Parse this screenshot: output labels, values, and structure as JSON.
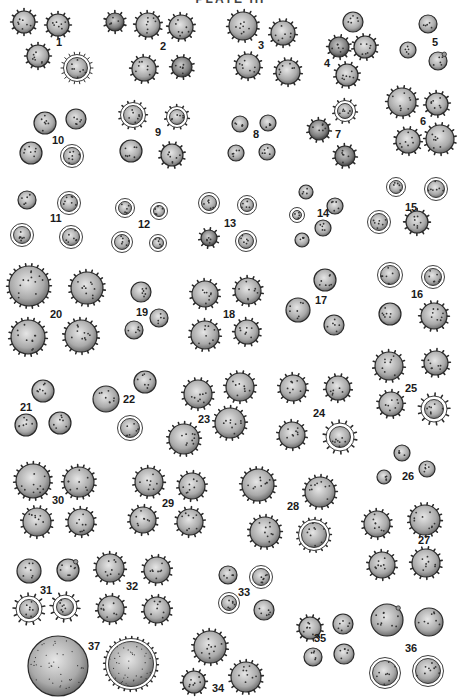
{
  "plate": {
    "title": "PLATE III",
    "ink_color": "#2a2a2a",
    "fill_color": "#bdbdbd",
    "background": "#ffffff"
  },
  "figures": [
    {
      "n": "1",
      "label_xy": [
        56,
        46
      ],
      "grains": [
        [
          24,
          22,
          11,
          "spiny"
        ],
        [
          58,
          25,
          11,
          "spiny"
        ],
        [
          38,
          56,
          11,
          "spiny"
        ],
        [
          77,
          68,
          13,
          "radial"
        ]
      ]
    },
    {
      "n": "2",
      "label_xy": [
        160,
        50
      ],
      "grains": [
        [
          115,
          22,
          9,
          "spiny"
        ],
        [
          148,
          25,
          12,
          "spiny"
        ],
        [
          181,
          27,
          12,
          "spiny"
        ],
        [
          144,
          69,
          12,
          "spiny"
        ],
        [
          182,
          67,
          10,
          "spiny"
        ]
      ]
    },
    {
      "n": "3",
      "label_xy": [
        258,
        49
      ],
      "grains": [
        [
          243,
          26,
          14,
          "spiny"
        ],
        [
          283,
          33,
          12,
          "spiny"
        ],
        [
          248,
          66,
          12,
          "spiny"
        ],
        [
          288,
          72,
          12,
          "spiny"
        ]
      ]
    },
    {
      "n": "4",
      "label_xy": [
        324,
        67
      ],
      "grains": [
        [
          353,
          22,
          10,
          "dotted"
        ],
        [
          339,
          47,
          10,
          "spiny"
        ],
        [
          365,
          47,
          11,
          "spiny"
        ],
        [
          347,
          75,
          11,
          "spiny"
        ]
      ]
    },
    {
      "n": "5",
      "label_xy": [
        432,
        46
      ],
      "grains": [
        [
          428,
          24,
          9,
          "dotted"
        ],
        [
          408,
          50,
          8,
          "dotted"
        ],
        [
          438,
          61,
          9,
          "tipped"
        ]
      ]
    },
    {
      "n": "6",
      "label_xy": [
        420,
        125
      ],
      "grains": [
        [
          402,
          102,
          14,
          "spiny"
        ],
        [
          437,
          104,
          11,
          "spiny"
        ],
        [
          408,
          141,
          12,
          "spiny"
        ],
        [
          440,
          139,
          14,
          "spiny"
        ]
      ]
    },
    {
      "n": "7",
      "label_xy": [
        335,
        138
      ],
      "grains": [
        [
          345,
          111,
          10,
          "ring-spiny"
        ],
        [
          319,
          130,
          10,
          "spiny"
        ],
        [
          345,
          156,
          10,
          "spiny"
        ]
      ]
    },
    {
      "n": "8",
      "label_xy": [
        253,
        138
      ],
      "grains": [
        [
          240,
          124,
          8,
          "dotted"
        ],
        [
          268,
          123,
          8,
          "dotted"
        ],
        [
          236,
          153,
          8,
          "dotted"
        ],
        [
          267,
          152,
          8,
          "dotted"
        ]
      ]
    },
    {
      "n": "9",
      "label_xy": [
        155,
        136
      ],
      "grains": [
        [
          133,
          115,
          12,
          "ring-spiny"
        ],
        [
          177,
          117,
          10,
          "ring-spiny"
        ],
        [
          131,
          151,
          11,
          "dotted"
        ],
        [
          172,
          155,
          11,
          "spiny"
        ]
      ]
    },
    {
      "n": "10",
      "label_xy": [
        52,
        144
      ],
      "grains": [
        [
          45,
          123,
          11,
          "dotted"
        ],
        [
          76,
          119,
          10,
          "dotted"
        ],
        [
          31,
          153,
          11,
          "dotted"
        ],
        [
          72,
          156,
          11,
          "ring"
        ]
      ]
    },
    {
      "n": "11",
      "label_xy": [
        50,
        222
      ],
      "grains": [
        [
          27,
          200,
          9,
          "dotted"
        ],
        [
          69,
          203,
          11,
          "ring"
        ],
        [
          22,
          235,
          11,
          "ring"
        ],
        [
          71,
          237,
          11,
          "ring"
        ]
      ]
    },
    {
      "n": "12",
      "label_xy": [
        138,
        228
      ],
      "grains": [
        [
          125,
          208,
          9,
          "ring"
        ],
        [
          159,
          211,
          8,
          "ring"
        ],
        [
          122,
          242,
          10,
          "ring"
        ],
        [
          158,
          243,
          8,
          "ring"
        ]
      ]
    },
    {
      "n": "13",
      "label_xy": [
        224,
        227
      ],
      "grains": [
        [
          209,
          203,
          10,
          "ring"
        ],
        [
          247,
          205,
          9,
          "ring"
        ],
        [
          209,
          238,
          8,
          "spiny"
        ],
        [
          246,
          241,
          10,
          "ring"
        ]
      ]
    },
    {
      "n": "14",
      "label_xy": [
        317,
        217
      ],
      "grains": [
        [
          306,
          192,
          7,
          "dotted"
        ],
        [
          335,
          206,
          8,
          "dotted"
        ],
        [
          297,
          215,
          7,
          "ring"
        ],
        [
          323,
          228,
          8,
          "dotted"
        ],
        [
          302,
          240,
          7,
          "dotted"
        ]
      ]
    },
    {
      "n": "15",
      "label_xy": [
        405,
        211
      ],
      "grains": [
        [
          396,
          187,
          9,
          "ring"
        ],
        [
          436,
          189,
          11,
          "ring"
        ],
        [
          379,
          222,
          11,
          "ring"
        ],
        [
          417,
          222,
          11,
          "spiny"
        ]
      ]
    },
    {
      "n": "16",
      "label_xy": [
        411,
        298
      ],
      "grains": [
        [
          390,
          275,
          12,
          "ring"
        ],
        [
          433,
          277,
          11,
          "ring"
        ],
        [
          390,
          314,
          11,
          "dotted"
        ],
        [
          434,
          316,
          13,
          "spiny"
        ]
      ]
    },
    {
      "n": "17",
      "label_xy": [
        315,
        304
      ],
      "grains": [
        [
          325,
          280,
          11,
          "dotted"
        ],
        [
          298,
          310,
          12,
          "dotted"
        ],
        [
          334,
          325,
          10,
          "dotted"
        ]
      ]
    },
    {
      "n": "18",
      "label_xy": [
        223,
        318
      ],
      "grains": [
        [
          205,
          294,
          13,
          "spiny"
        ],
        [
          248,
          291,
          13,
          "spiny"
        ],
        [
          205,
          335,
          14,
          "spiny"
        ],
        [
          247,
          332,
          12,
          "spiny"
        ]
      ]
    },
    {
      "n": "19",
      "label_xy": [
        136,
        316
      ],
      "grains": [
        [
          141,
          292,
          10,
          "dotted"
        ],
        [
          159,
          318,
          9,
          "dotted"
        ],
        [
          134,
          330,
          9,
          "dotted"
        ]
      ]
    },
    {
      "n": "20",
      "label_xy": [
        50,
        318
      ],
      "grains": [
        [
          29,
          286,
          20,
          "spiny"
        ],
        [
          87,
          288,
          16,
          "spiny"
        ],
        [
          28,
          337,
          17,
          "spiny"
        ],
        [
          81,
          336,
          16,
          "spiny"
        ]
      ]
    },
    {
      "n": "21",
      "label_xy": [
        20,
        411
      ],
      "grains": [
        [
          43,
          391,
          11,
          "dotted"
        ],
        [
          26,
          425,
          11,
          "dotted"
        ],
        [
          60,
          423,
          11,
          "dotted"
        ]
      ]
    },
    {
      "n": "22",
      "label_xy": [
        123,
        403
      ],
      "grains": [
        [
          106,
          399,
          13,
          "dotted"
        ],
        [
          145,
          382,
          11,
          "dotted"
        ],
        [
          130,
          428,
          12,
          "ring"
        ]
      ]
    },
    {
      "n": "23",
      "label_xy": [
        198,
        423
      ],
      "grains": [
        [
          198,
          394,
          14,
          "spiny"
        ],
        [
          240,
          387,
          14,
          "spiny"
        ],
        [
          184,
          439,
          15,
          "spiny"
        ],
        [
          230,
          423,
          15,
          "spiny"
        ]
      ]
    },
    {
      "n": "24",
      "label_xy": [
        313,
        417
      ],
      "grains": [
        [
          293,
          388,
          13,
          "spiny"
        ],
        [
          338,
          388,
          12,
          "spiny"
        ],
        [
          292,
          435,
          13,
          "spiny"
        ],
        [
          340,
          437,
          13,
          "star"
        ]
      ]
    },
    {
      "n": "25",
      "label_xy": [
        405,
        392
      ],
      "grains": [
        [
          389,
          366,
          14,
          "spiny"
        ],
        [
          436,
          363,
          12,
          "spiny"
        ],
        [
          391,
          404,
          12,
          "spiny"
        ],
        [
          434,
          409,
          12,
          "star"
        ]
      ]
    },
    {
      "n": "26",
      "label_xy": [
        402,
        480
      ],
      "grains": [
        [
          402,
          453,
          8,
          "dotted"
        ],
        [
          384,
          477,
          7,
          "dotted"
        ],
        [
          427,
          469,
          8,
          "dotted"
        ]
      ]
    },
    {
      "n": "27",
      "label_xy": [
        418,
        544
      ],
      "grains": [
        [
          377,
          524,
          13,
          "spiny"
        ],
        [
          425,
          520,
          15,
          "spiny"
        ],
        [
          382,
          565,
          13,
          "spiny"
        ],
        [
          426,
          563,
          14,
          "spiny"
        ]
      ]
    },
    {
      "n": "28",
      "label_xy": [
        287,
        510
      ],
      "grains": [
        [
          258,
          485,
          16,
          "spiny"
        ],
        [
          320,
          492,
          15,
          "spiny"
        ],
        [
          265,
          532,
          15,
          "spiny"
        ],
        [
          314,
          535,
          15,
          "ring-spiny"
        ]
      ]
    },
    {
      "n": "29",
      "label_xy": [
        162,
        507
      ],
      "grains": [
        [
          149,
          482,
          14,
          "spiny"
        ],
        [
          192,
          486,
          13,
          "spiny"
        ],
        [
          143,
          520,
          13,
          "spiny"
        ],
        [
          190,
          522,
          13,
          "spiny"
        ]
      ]
    },
    {
      "n": "30",
      "label_xy": [
        52,
        504
      ],
      "grains": [
        [
          33,
          481,
          17,
          "spiny"
        ],
        [
          79,
          482,
          15,
          "spiny"
        ],
        [
          37,
          522,
          14,
          "spiny"
        ],
        [
          81,
          522,
          13,
          "spiny"
        ]
      ]
    },
    {
      "n": "31",
      "label_xy": [
        40,
        594
      ],
      "grains": [
        [
          29,
          571,
          12,
          "dotted"
        ],
        [
          68,
          570,
          11,
          "tipped"
        ],
        [
          29,
          609,
          12,
          "star"
        ],
        [
          65,
          607,
          11,
          "star"
        ]
      ]
    },
    {
      "n": "32",
      "label_xy": [
        126,
        590
      ],
      "grains": [
        [
          110,
          568,
          14,
          "spiny"
        ],
        [
          157,
          570,
          13,
          "spiny"
        ],
        [
          111,
          609,
          13,
          "spiny"
        ],
        [
          157,
          610,
          13,
          "spiny"
        ]
      ]
    },
    {
      "n": "33",
      "label_xy": [
        238,
        596
      ],
      "grains": [
        [
          228,
          575,
          9,
          "dotted"
        ],
        [
          261,
          577,
          11,
          "ring"
        ],
        [
          229,
          603,
          10,
          "ring"
        ],
        [
          264,
          610,
          10,
          "dotted"
        ]
      ]
    },
    {
      "n": "34",
      "label_xy": [
        212,
        692
      ],
      "grains": [
        [
          210,
          647,
          16,
          "spiny"
        ],
        [
          194,
          682,
          11,
          "spiny"
        ],
        [
          246,
          677,
          15,
          "spiny"
        ]
      ]
    },
    {
      "n": "35",
      "label_xy": [
        314,
        642
      ],
      "grains": [
        [
          310,
          628,
          11,
          "spiny"
        ],
        [
          343,
          624,
          10,
          "dotted"
        ],
        [
          313,
          657,
          9,
          "dotted"
        ],
        [
          344,
          654,
          10,
          "dotted"
        ]
      ]
    },
    {
      "n": "36",
      "label_xy": [
        405,
        652
      ],
      "grains": [
        [
          387,
          620,
          16,
          "tipped"
        ],
        [
          429,
          622,
          14,
          "dotted"
        ],
        [
          385,
          673,
          15,
          "ring"
        ],
        [
          428,
          671,
          15,
          "ring"
        ]
      ]
    },
    {
      "n": "37",
      "label_xy": [
        88,
        650
      ],
      "grains": [
        [
          58,
          666,
          30,
          "dense"
        ],
        [
          131,
          664,
          25,
          "dense-ring"
        ]
      ]
    }
  ]
}
